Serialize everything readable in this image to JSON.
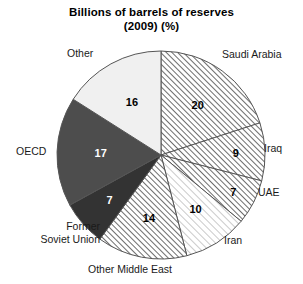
{
  "chart_data": {
    "type": "pie",
    "title": "Billions of barrels of reserves\n(2009) (%)",
    "title_line1": "Billions of barrels of reserves",
    "title_line2": "(2009) (%)",
    "unit": "%",
    "total": 100,
    "start_angle_deg": 0,
    "direction": "clockwise",
    "legend": "none (direct labels)",
    "categories": [
      "Saudi Arabia",
      "Iraq",
      "UAE",
      "Iran",
      "Other Middle East",
      "Former Soviet Union",
      "OECD",
      "Other"
    ],
    "values": [
      20,
      9,
      7,
      10,
      14,
      7,
      17,
      16
    ],
    "slices": [
      {
        "label": "Saudi Arabia",
        "label_display": "Saudi Arabia",
        "value": 20,
        "value_text": "20",
        "fill": "hatch-medium",
        "fill_color": "#ffffff",
        "hatch_color": "#6e6e6e",
        "value_text_color": "#000000"
      },
      {
        "label": "Iraq",
        "label_display": "Iraq",
        "value": 9,
        "value_text": "9",
        "fill": "hatch-medium",
        "fill_color": "#ffffff",
        "hatch_color": "#6e6e6e",
        "value_text_color": "#000000"
      },
      {
        "label": "UAE",
        "label_display": "UAE",
        "value": 7,
        "value_text": "7",
        "fill": "hatch-medium",
        "fill_color": "#ffffff",
        "hatch_color": "#6e6e6e",
        "value_text_color": "#000000"
      },
      {
        "label": "Iran",
        "label_display": "Iran",
        "value": 10,
        "value_text": "10",
        "fill": "hatch-light",
        "fill_color": "#ffffff",
        "hatch_color": "#b4b4b4",
        "value_text_color": "#000000"
      },
      {
        "label": "Other Middle East",
        "label_display": "Other Middle East",
        "value": 14,
        "value_text": "14",
        "fill": "hatch-medium",
        "fill_color": "#ffffff",
        "hatch_color": "#6e6e6e",
        "value_text_color": "#000000"
      },
      {
        "label": "Former Soviet Union",
        "label_display": "Former\nSoviet Union",
        "value": 7,
        "value_text": "7",
        "fill": "solid",
        "fill_color": "#333333",
        "hatch_color": "",
        "value_text_color": "#ffffff"
      },
      {
        "label": "OECD",
        "label_display": "OECD",
        "value": 17,
        "value_text": "17",
        "fill": "solid",
        "fill_color": "#4d4d4d",
        "hatch_color": "",
        "value_text_color": "#ffffff"
      },
      {
        "label": "Other",
        "label_display": "Other",
        "value": 16,
        "value_text": "16",
        "fill": "solid",
        "fill_color": "#f0f0f0",
        "hatch_color": "",
        "value_text_color": "#000000"
      }
    ]
  },
  "colors": {
    "background": "#ffffff",
    "outline": "#555555",
    "text": "#000000",
    "solid_dark": "#333333",
    "solid_gray": "#4d4d4d",
    "solid_light": "#f0f0f0"
  }
}
